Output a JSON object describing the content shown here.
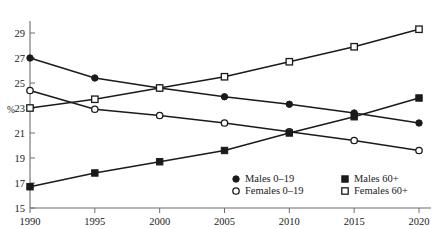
{
  "chart_data": {
    "type": "line",
    "title": "",
    "subtitle": "",
    "xlabel": "",
    "ylabel": "%",
    "x": [
      1990,
      1995,
      2000,
      2005,
      2010,
      2015,
      2020
    ],
    "xtick_labels": [
      "1990",
      "1995",
      "2000",
      "2005",
      "2010",
      "2015",
      "2020"
    ],
    "ytick_labels": [
      "15",
      "17",
      "19",
      "21",
      "23",
      "25",
      "27",
      "29"
    ],
    "ytick_values": [
      15,
      17,
      19,
      21,
      23,
      25,
      27,
      29
    ],
    "xlim": [
      1990,
      2020
    ],
    "ylim": [
      15,
      29.8
    ],
    "grid": false,
    "legend_position": "inside-bottom-right",
    "series": [
      {
        "name": "Males 0–19",
        "marker": "filled-circle",
        "color": "#1a1a1a",
        "values": [
          27.0,
          25.4,
          24.6,
          23.9,
          23.3,
          22.6,
          21.8
        ]
      },
      {
        "name": "Females 0–19",
        "marker": "open-circle",
        "color": "#1a1a1a",
        "values": [
          24.4,
          22.9,
          22.4,
          21.8,
          21.1,
          20.4,
          19.6
        ]
      },
      {
        "name": "Males 60+",
        "marker": "filled-square",
        "color": "#1a1a1a",
        "values": [
          16.7,
          17.8,
          18.7,
          19.6,
          21.0,
          22.3,
          23.8
        ]
      },
      {
        "name": "Females 60+",
        "marker": "open-square",
        "color": "#1a1a1a",
        "values": [
          23.0,
          23.7,
          24.6,
          25.5,
          26.7,
          27.9,
          29.3
        ]
      }
    ],
    "legend": [
      {
        "label": "Males 0–19",
        "marker": "filled-circle"
      },
      {
        "label": "Males 60+",
        "marker": "filled-square"
      },
      {
        "label": "Females 0–19",
        "marker": "open-circle"
      },
      {
        "label": "Females 60+",
        "marker": "open-square"
      }
    ]
  }
}
